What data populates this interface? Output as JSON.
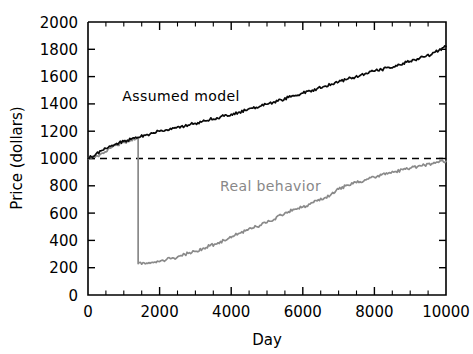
{
  "chart_data": {
    "type": "line",
    "title": "",
    "xlabel": "Day",
    "ylabel": "Price (dollars)",
    "xlim": [
      0,
      10000
    ],
    "ylim": [
      0,
      2000
    ],
    "xticks": [
      0,
      2000,
      4000,
      6000,
      8000,
      10000
    ],
    "xtick_labels": [
      "0",
      "2000",
      "4000",
      "6000",
      "8000",
      "10000"
    ],
    "xtick_minor_step": 500,
    "yticks": [
      0,
      200,
      400,
      600,
      800,
      1000,
      1200,
      1400,
      1600,
      1800,
      2000
    ],
    "ytick_labels": [
      "0",
      "200",
      "400",
      "600",
      "800",
      "1000",
      "1200",
      "1400",
      "1600",
      "1800",
      "2000"
    ],
    "grid": false,
    "legend_position": "inline-annotations",
    "colors": {
      "assumed_model": "#0a0a0a",
      "real_behavior": "#8a8a8a",
      "reference_line": "#000000",
      "axes": "#000000",
      "background": "#ffffff"
    },
    "annotations": [
      {
        "name": "assumed-model-label",
        "text": "Assumed model",
        "x": 2600,
        "y": 1420,
        "color": "#0a0a0a"
      },
      {
        "name": "real-behavior-label",
        "text": "Real behavior",
        "x": 5100,
        "y": 760,
        "color": "#8a8a8a"
      }
    ],
    "reference_line": {
      "name": "initial-price-reference",
      "y": 1000,
      "style": "dashed",
      "x_from": 0,
      "x_to": 10000
    },
    "series": [
      {
        "name": "Assumed model",
        "style": "solid",
        "color": "#0a0a0a",
        "x": [
          0,
          200,
          400,
          600,
          800,
          1000,
          1200,
          1400,
          1600,
          1800,
          2000,
          2200,
          2400,
          2600,
          2800,
          3000,
          3200,
          3400,
          3600,
          3800,
          4000,
          4200,
          4400,
          4600,
          4800,
          5000,
          5200,
          5400,
          5600,
          5800,
          6000,
          6200,
          6400,
          6600,
          6800,
          7000,
          7200,
          7400,
          7600,
          7800,
          8000,
          8200,
          8400,
          8600,
          8800,
          9000,
          9200,
          9400,
          9600,
          9800,
          10000
        ],
        "values": [
          1000,
          1025,
          1060,
          1090,
          1110,
          1125,
          1140,
          1155,
          1170,
          1185,
          1200,
          1210,
          1222,
          1235,
          1245,
          1258,
          1272,
          1285,
          1298,
          1310,
          1325,
          1338,
          1352,
          1368,
          1382,
          1398,
          1415,
          1430,
          1448,
          1462,
          1478,
          1495,
          1512,
          1528,
          1545,
          1560,
          1578,
          1592,
          1608,
          1622,
          1640,
          1652,
          1668,
          1682,
          1698,
          1712,
          1730,
          1745,
          1762,
          1792,
          1820
        ]
      },
      {
        "name": "Real behavior",
        "style": "solid-with-crash",
        "color": "#8a8a8a",
        "crash_day": 1400,
        "crash_from": 1150,
        "crash_to": 230,
        "x": [
          0,
          200,
          400,
          600,
          800,
          1000,
          1200,
          1400,
          1400,
          1600,
          1800,
          2000,
          2200,
          2400,
          2600,
          2800,
          3000,
          3200,
          3400,
          3600,
          3800,
          4000,
          4200,
          4400,
          4600,
          4800,
          5000,
          5200,
          5400,
          5600,
          5800,
          6000,
          6200,
          6400,
          6600,
          6800,
          7000,
          7200,
          7400,
          7600,
          7800,
          8000,
          8200,
          8400,
          8600,
          8800,
          9000,
          9200,
          9400,
          9600,
          9800,
          10000
        ],
        "values": [
          1000,
          1010,
          1040,
          1075,
          1100,
          1118,
          1135,
          1150,
          230,
          228,
          240,
          245,
          262,
          270,
          290,
          305,
          320,
          340,
          360,
          375,
          400,
          420,
          450,
          470,
          490,
          510,
          530,
          555,
          585,
          610,
          630,
          645,
          665,
          690,
          710,
          740,
          775,
          800,
          815,
          830,
          850,
          862,
          880,
          895,
          905,
          918,
          930,
          940,
          952,
          962,
          972,
          980
        ]
      }
    ]
  }
}
